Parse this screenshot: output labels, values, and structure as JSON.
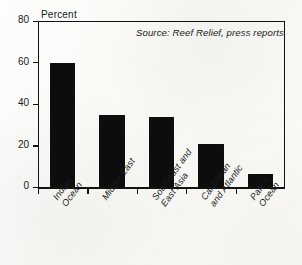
{
  "figure": {
    "yaxis_title": "Percent",
    "source_note": "Source: Reef Relief, press reports"
  },
  "chart_data": {
    "type": "bar",
    "title": "",
    "subtitle": "",
    "xlabel": "",
    "ylabel": "Percent",
    "ylim": [
      0,
      80
    ],
    "yticks": [
      0,
      20,
      40,
      60,
      80
    ],
    "ytick_labels": [
      "0",
      "20",
      "40",
      "60",
      "80"
    ],
    "grid": false,
    "legend": "none",
    "bar_color": "#0d0d0d",
    "categories": [
      "Indian Ocean",
      "Middle East",
      "Southeast and East Asia",
      "Caribbean and Atlantic",
      "Paficic Ocean"
    ],
    "category_lines": [
      [
        "Indian",
        "Ocean"
      ],
      [
        "Middle East",
        ""
      ],
      [
        "Southeast and",
        "East Asia"
      ],
      [
        "Caribbean",
        "and Atlantic"
      ],
      [
        "Paficic",
        "Ocean"
      ]
    ],
    "values": [
      60,
      35,
      34,
      21,
      6.5
    ],
    "annotations": [
      {
        "text": "Source: Reef Relief, press reports",
        "position": "top-right-inside-plot",
        "style": "italic"
      }
    ]
  }
}
